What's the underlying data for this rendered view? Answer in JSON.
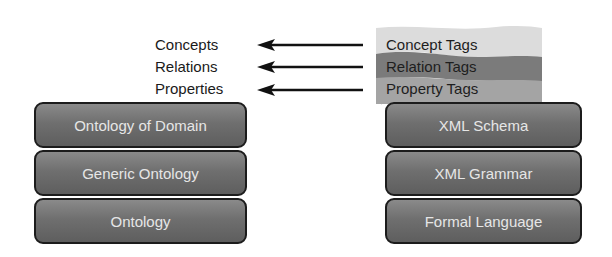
{
  "left_labels": [
    "Concepts",
    "Relations",
    "Properties"
  ],
  "tags": [
    "Concept Tags",
    "Relation Tags",
    "Property Tags"
  ],
  "left_stack": [
    "Ontology of Domain",
    "Generic Ontology",
    "Ontology"
  ],
  "right_stack": [
    "XML Schema",
    "XML Grammar",
    "Formal Language"
  ],
  "colors": {
    "band_top": "#d9d9d9",
    "band_mid": "#7d7d7d",
    "band_bottom": "#a6a6a6",
    "block_fill": "#6f6f6f",
    "block_border": "#1c1c1c",
    "block_text": "#e6e6e6"
  }
}
